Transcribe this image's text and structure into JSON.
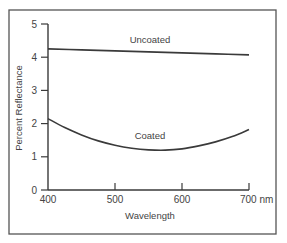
{
  "chart_data": {
    "type": "line",
    "title": "",
    "xlabel": "Wavelength",
    "x_unit": "nm",
    "ylabel": "Percent Reflectance",
    "xlim": [
      400,
      700
    ],
    "ylim": [
      0,
      5
    ],
    "xticks": [
      400,
      500,
      600,
      700
    ],
    "xtick_labels": [
      "400",
      "500",
      "600",
      "700 nm"
    ],
    "yticks": [
      0,
      1,
      2,
      3,
      4,
      5
    ],
    "ytick_labels": [
      "0",
      "1",
      "2",
      "3",
      "4",
      "5"
    ],
    "grid": false,
    "legend": "none (inline series labels)",
    "series": [
      {
        "name": "Uncoated",
        "x": [
          400,
          450,
          500,
          550,
          600,
          650,
          700
        ],
        "values": [
          4.25,
          4.22,
          4.19,
          4.16,
          4.13,
          4.1,
          4.07
        ]
      },
      {
        "name": "Coated",
        "x": [
          400,
          425,
          450,
          475,
          500,
          525,
          550,
          575,
          600,
          625,
          650,
          675,
          700
        ],
        "values": [
          2.15,
          1.88,
          1.66,
          1.48,
          1.35,
          1.26,
          1.21,
          1.2,
          1.24,
          1.33,
          1.45,
          1.61,
          1.82
        ]
      }
    ],
    "annotations": [
      {
        "text": "Uncoated",
        "near_series": "Uncoated"
      },
      {
        "text": "Coated",
        "near_series": "Coated"
      }
    ]
  },
  "colors": {
    "line": "#3a3a3a",
    "frame": "#555555",
    "text": "#444444"
  }
}
